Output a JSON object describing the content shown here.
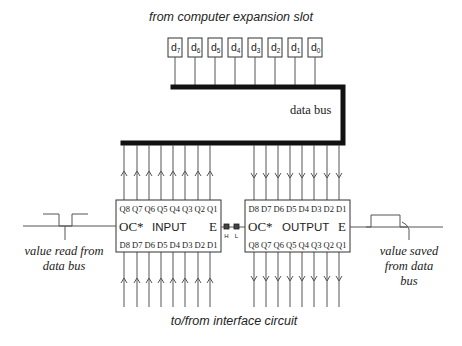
{
  "title_top": "from computer expansion slot",
  "title_bottom": "to/from interface circuit",
  "bus_label": "data bus",
  "data_lines": [
    {
      "base": "d",
      "sub": "7",
      "x": 168
    },
    {
      "base": "d",
      "sub": "6",
      "x": 188
    },
    {
      "base": "d",
      "sub": "5",
      "x": 208
    },
    {
      "base": "d",
      "sub": "4",
      "x": 228
    },
    {
      "base": "d",
      "sub": "3",
      "x": 248
    },
    {
      "base": "d",
      "sub": "2",
      "x": 268
    },
    {
      "base": "d",
      "sub": "1",
      "x": 288
    },
    {
      "base": "d",
      "sub": "0",
      "x": 308
    }
  ],
  "input_chip": {
    "name": "INPUT",
    "oc_label": "OC*",
    "enable_label": "E",
    "top_pins": "Q8 Q7 Q6 Q5 Q4 Q3 Q2 Q1",
    "bottom_pins": "D8 D7 D6 D5 D4 D3 D2 D1",
    "pin_x": [
      124,
      137,
      149,
      161,
      173,
      185,
      198,
      210
    ]
  },
  "output_chip": {
    "name": "OUTPUT",
    "oc_label": "OC*",
    "enable_label": "E",
    "top_pins": "D8 D7 D6 D5 D4 D3 D2 D1",
    "bottom_pins": "Q8 Q7 Q6 Q5 Q4 Q3 Q2 Q1",
    "pin_x": [
      254,
      266,
      278,
      290,
      302,
      314,
      327,
      339
    ]
  },
  "switch": {
    "high_label": "H",
    "low_label": "L"
  },
  "left_waveform_caption": [
    "value read from",
    "data bus"
  ],
  "right_waveform_caption": [
    "value saved",
    "from data",
    "bus"
  ],
  "colors": {
    "line": "#555555",
    "bus": "#111111",
    "text": "#222222",
    "background": "#ffffff"
  }
}
